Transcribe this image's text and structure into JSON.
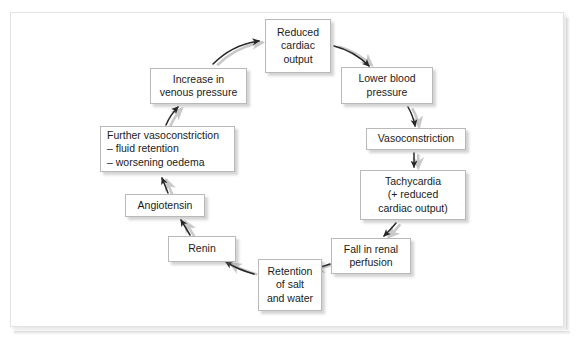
{
  "page": {
    "background_color": "#ffffff",
    "frame_border_color": "#e3e3e3",
    "node_border_color": "#b9b9b9",
    "arrow_color": "#262626",
    "text_color": "#1b1b1b"
  },
  "diagram": {
    "type": "cycle-flowchart",
    "direction": "clockwise",
    "node_count": 10,
    "arrow_count": 10
  },
  "nodes": [
    {
      "id": "reduced-cardiac-output",
      "label": "Reduced\ncardiac\noutput",
      "lines": [
        "Reduced",
        "cardiac",
        "output"
      ],
      "position": "top"
    },
    {
      "id": "lower-blood-pressure",
      "label": "Lower blood\npressure",
      "lines": [
        "Lower blood",
        "pressure"
      ],
      "position": "upper-right"
    },
    {
      "id": "vasoconstriction",
      "label": "Vasoconstriction",
      "lines": [
        "Vasoconstriction"
      ],
      "position": "right"
    },
    {
      "id": "tachycardia",
      "label": "Tachycardia\n(+ reduced\ncardiac output)",
      "lines": [
        "Tachycardia",
        "(+ reduced",
        "cardiac output)"
      ],
      "position": "right-lower"
    },
    {
      "id": "fall-in-renal-perfusion",
      "label": "Fall in renal\nperfusion",
      "lines": [
        "Fall in renal",
        "perfusion"
      ],
      "position": "lower-right"
    },
    {
      "id": "retention-of-salt-and-water",
      "label": "Retention\nof salt\nand water",
      "lines": [
        "Retention",
        "of salt",
        "and water"
      ],
      "position": "bottom"
    },
    {
      "id": "renin",
      "label": "Renin",
      "lines": [
        "Renin"
      ],
      "position": "lower-left"
    },
    {
      "id": "angiotensin",
      "label": "Angiotensin",
      "lines": [
        "Angiotensin"
      ],
      "position": "left-lower"
    },
    {
      "id": "further-vasoconstriction",
      "label": "Further vasoconstriction\n– fluid retention\n– worsening oedema",
      "lines": [
        "Further vasoconstriction",
        "– fluid retention",
        "– worsening oedema"
      ],
      "position": "left"
    },
    {
      "id": "increase-in-venous-pressure",
      "label": "Increase in\nvenous pressure",
      "lines": [
        "Increase in",
        "venous pressure"
      ],
      "position": "upper-left"
    }
  ],
  "edges": [
    {
      "from": "reduced-cardiac-output",
      "to": "lower-blood-pressure"
    },
    {
      "from": "lower-blood-pressure",
      "to": "vasoconstriction"
    },
    {
      "from": "vasoconstriction",
      "to": "tachycardia"
    },
    {
      "from": "tachycardia",
      "to": "fall-in-renal-perfusion"
    },
    {
      "from": "fall-in-renal-perfusion",
      "to": "retention-of-salt-and-water"
    },
    {
      "from": "retention-of-salt-and-water",
      "to": "renin"
    },
    {
      "from": "renin",
      "to": "angiotensin"
    },
    {
      "from": "angiotensin",
      "to": "further-vasoconstriction"
    },
    {
      "from": "further-vasoconstriction",
      "to": "increase-in-venous-pressure"
    },
    {
      "from": "increase-in-venous-pressure",
      "to": "reduced-cardiac-output"
    }
  ]
}
